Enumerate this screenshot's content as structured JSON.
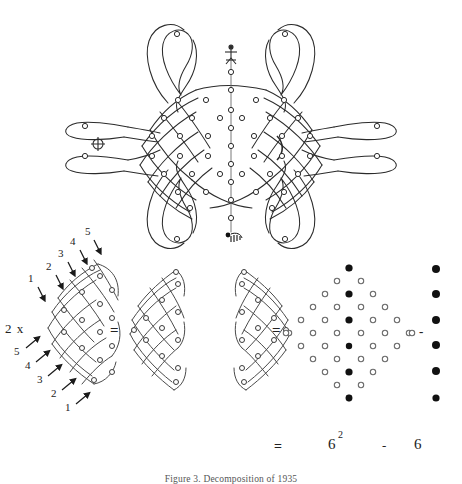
{
  "figure": {
    "caption": "Figure 3. Decomposition of 1935",
    "caption_top_px": 474
  },
  "top_panel": {
    "name": "sona-lusona-knot-drawing",
    "description": "Symmetric single-stroke loop drawing (sona/kolam) woven around a lattice of small open dots, with four outer lobe pairs and a vertical central axis of dots",
    "symbols": [
      {
        "name": "crossed-circle-symbol",
        "glyph": "+",
        "x": 98,
        "y": 144
      },
      {
        "name": "crescent-arc-symbol",
        "glyph": ")",
        "x": 281,
        "y": 147
      },
      {
        "name": "stick-figure-symbol",
        "x": 192,
        "y": 52
      },
      {
        "name": "comb-motif-symbol",
        "x": 192,
        "y": 235
      }
    ],
    "axis_dot_count": 12,
    "lattice_rows": 7
  },
  "bottom_panel": {
    "left_diagram": {
      "name": "left-half-lattice",
      "x_label": "2 x",
      "top_arrow_labels": [
        "1",
        "2",
        "3",
        "4",
        "5"
      ],
      "bottom_arrow_labels": [
        "5",
        "4",
        "3",
        "2",
        "1"
      ],
      "top_arrow_direction": "down",
      "bottom_arrow_direction": "up-right"
    },
    "operator_1": "=",
    "middle_diagram": {
      "name": "mirrored-double-lattice",
      "halves": 2
    },
    "operator_2": "=",
    "dot_diagram": {
      "name": "dot-lattice-diamond",
      "open_dot_label": "o",
      "filled_column_count": 6,
      "rows": 11
    },
    "operator_3": "-",
    "right_column": {
      "name": "black-dot-column",
      "dot_count": 6
    }
  },
  "equation_line": {
    "equals": "=",
    "term_base": "6",
    "term_exponent": "2",
    "minus": "-",
    "subtrahend": "6"
  },
  "colors": {
    "ink": "#2b2b2b",
    "paper": "#ffffff",
    "faint": "#7a7a7a"
  }
}
